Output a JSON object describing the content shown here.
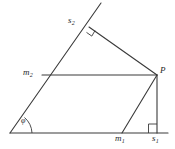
{
  "figure": {
    "background_color": "#ffffff",
    "stroke_color": "#3a3a3a",
    "label_color": "#262626",
    "labels": {
      "s2": "s",
      "s2_sub": "2",
      "m2": "m",
      "m2_sub": "2",
      "P": "P",
      "m1": "m",
      "m1_sub": "1",
      "s1": "s",
      "s1_sub": "1",
      "phi": "φ"
    },
    "points": {
      "origin": {
        "x": 10,
        "y": 133
      },
      "base_end": {
        "x": 168,
        "y": 133
      },
      "ray_tip": {
        "x": 101,
        "y": 3
      },
      "m2": {
        "x": 42,
        "y": 75
      },
      "s2": {
        "x": 89,
        "y": 27
      },
      "P": {
        "x": 157,
        "y": 75
      },
      "m1": {
        "x": 122,
        "y": 133
      },
      "s1": {
        "x": 157,
        "y": 133
      }
    },
    "segments": [
      {
        "name": "base-line",
        "x1": 10,
        "y1": 133,
        "x2": 168,
        "y2": 133
      },
      {
        "name": "oblique-ray",
        "x1": 10,
        "y1": 133,
        "x2": 101,
        "y2": 3
      },
      {
        "name": "mid-horizontal-m2-P",
        "x1": 42,
        "y1": 75,
        "x2": 157,
        "y2": 75
      },
      {
        "name": "diagonal-s2-P",
        "x1": 89,
        "y1": 27,
        "x2": 157,
        "y2": 75
      },
      {
        "name": "vertical-P-s1",
        "x1": 157,
        "y1": 75,
        "x2": 157,
        "y2": 133
      },
      {
        "name": "diagonal-m1-P",
        "x1": 122,
        "y1": 133,
        "x2": 157,
        "y2": 75
      }
    ],
    "markers": {
      "right_angle_at_s2": true,
      "right_angle_at_s1": true,
      "angle_arc_at_origin": true
    }
  }
}
